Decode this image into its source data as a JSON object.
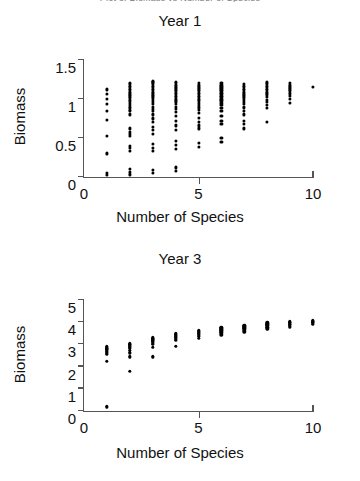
{
  "figure": {
    "cut_off_title": "Plot of Biomass vs Number of Species",
    "xlabel": "Number of Species",
    "ylabel": "Biomass"
  },
  "chart_data": [
    {
      "type": "scatter",
      "title": "Year 1",
      "xlabel": "Number of Species",
      "ylabel": "Biomass",
      "xlim": [
        0,
        10
      ],
      "ylim": [
        0,
        1.5
      ],
      "xticks": [
        0,
        5,
        10
      ],
      "yticks": [
        0,
        0.5,
        1,
        1.5
      ],
      "xtick_labels": [
        "0",
        "5",
        "10"
      ],
      "ytick_labels": [
        "0",
        "0.5",
        "1",
        "1.5"
      ],
      "grid": false,
      "legend": "none",
      "marker": "dot",
      "marker_color": "#000000",
      "points": [
        {
          "x": 1,
          "y": [
            0.02,
            0.05,
            0.3,
            0.52,
            0.73,
            0.85,
            0.93,
            1.0,
            1.06,
            1.12
          ]
        },
        {
          "x": 2,
          "y": [
            0.03,
            0.06,
            0.1,
            0.33,
            0.37,
            0.4,
            0.52,
            0.55,
            0.58,
            0.62,
            0.8,
            0.84,
            0.86,
            0.88,
            0.9,
            0.92,
            0.95,
            0.97,
            0.99,
            1.01,
            1.03,
            1.05,
            1.07,
            1.09,
            1.11,
            1.13,
            1.15,
            1.17,
            1.19,
            1.2
          ]
        },
        {
          "x": 3,
          "y": [
            0.05,
            0.09,
            0.33,
            0.37,
            0.42,
            0.55,
            0.6,
            0.64,
            0.7,
            0.75,
            0.8,
            0.84,
            0.87,
            0.9,
            0.93,
            0.96,
            0.99,
            1.01,
            1.03,
            1.05,
            1.07,
            1.09,
            1.11,
            1.13,
            1.15,
            1.17,
            1.19,
            1.21,
            1.22,
            1.23
          ]
        },
        {
          "x": 4,
          "y": [
            0.08,
            0.12,
            0.36,
            0.41,
            0.46,
            0.6,
            0.66,
            0.72,
            0.78,
            0.83,
            0.87,
            0.9,
            0.93,
            0.96,
            0.98,
            1.0,
            1.02,
            1.04,
            1.06,
            1.08,
            1.1,
            1.12,
            1.14,
            1.16,
            1.18,
            1.2,
            1.22
          ]
        },
        {
          "x": 5,
          "y": [
            0.38,
            0.44,
            0.62,
            0.66,
            0.7,
            0.76,
            0.82,
            0.86,
            0.89,
            0.92,
            0.95,
            0.98,
            1.0,
            1.02,
            1.04,
            1.06,
            1.08,
            1.1,
            1.12,
            1.14,
            1.16,
            1.18,
            1.2
          ]
        },
        {
          "x": 6,
          "y": [
            0.45,
            0.5,
            0.68,
            0.72,
            0.78,
            0.84,
            0.88,
            0.92,
            0.95,
            0.98,
            1.0,
            1.02,
            1.04,
            1.06,
            1.08,
            1.1,
            1.12,
            1.14,
            1.16,
            1.18,
            1.2
          ]
        },
        {
          "x": 7,
          "y": [
            0.62,
            0.68,
            0.72,
            0.8,
            0.85,
            0.89,
            0.93,
            0.96,
            0.99,
            1.01,
            1.03,
            1.05,
            1.07,
            1.09,
            1.11,
            1.13,
            1.15,
            1.17,
            1.19
          ]
        },
        {
          "x": 8,
          "y": [
            0.7,
            0.88,
            0.92,
            0.96,
            0.99,
            1.02,
            1.05,
            1.07,
            1.09,
            1.11,
            1.13,
            1.15,
            1.17,
            1.19,
            1.21
          ]
        },
        {
          "x": 9,
          "y": [
            0.95,
            1.0,
            1.04,
            1.07,
            1.1,
            1.12,
            1.14,
            1.16,
            1.18,
            1.2
          ]
        },
        {
          "x": 10,
          "y": [
            1.15
          ]
        }
      ]
    },
    {
      "type": "scatter",
      "title": "Year 3",
      "xlabel": "Number of Species",
      "ylabel": "Biomass",
      "xlim": [
        0,
        10
      ],
      "ylim": [
        0,
        5
      ],
      "xticks": [
        0,
        5,
        10
      ],
      "yticks": [
        0,
        1,
        2,
        3,
        4,
        5
      ],
      "xtick_labels": [
        "0",
        "5",
        "10"
      ],
      "ytick_labels": [
        "0",
        "1",
        "2",
        "3",
        "4",
        "5"
      ],
      "grid": false,
      "legend": "none",
      "marker": "dot",
      "marker_color": "#000000",
      "points": [
        {
          "x": 1,
          "y": [
            0.2,
            2.25,
            2.55,
            2.62,
            2.7,
            2.76,
            2.8,
            2.84,
            2.88,
            2.92
          ]
        },
        {
          "x": 2,
          "y": [
            1.8,
            2.45,
            2.62,
            2.74,
            2.82,
            2.88,
            2.93,
            2.97,
            3.0,
            3.04
          ]
        },
        {
          "x": 3,
          "y": [
            2.45,
            2.88,
            3.0,
            3.08,
            3.14,
            3.18,
            3.22,
            3.26,
            3.3
          ]
        },
        {
          "x": 4,
          "y": [
            2.92,
            3.18,
            3.26,
            3.32,
            3.38,
            3.42,
            3.46,
            3.5
          ]
        },
        {
          "x": 5,
          "y": [
            3.28,
            3.38,
            3.44,
            3.5,
            3.55,
            3.6,
            3.64
          ]
        },
        {
          "x": 6,
          "y": [
            3.44,
            3.52,
            3.58,
            3.64,
            3.69,
            3.73,
            3.77
          ]
        },
        {
          "x": 7,
          "y": [
            3.58,
            3.66,
            3.72,
            3.77,
            3.82,
            3.86
          ]
        },
        {
          "x": 8,
          "y": [
            3.7,
            3.78,
            3.84,
            3.89,
            3.93,
            3.97
          ]
        },
        {
          "x": 9,
          "y": [
            3.8,
            3.88,
            3.94,
            3.99,
            4.03
          ]
        },
        {
          "x": 10,
          "y": [
            3.92,
            3.98,
            4.02,
            4.06
          ]
        }
      ]
    }
  ]
}
